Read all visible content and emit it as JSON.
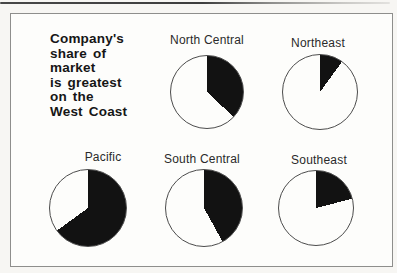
{
  "figure": {
    "headline_lines": [
      "Company's",
      "share of",
      "market",
      "is greatest",
      "on the",
      "West Coast"
    ],
    "headline_text": "Company's share of market is greatest on the West Coast"
  },
  "colors": {
    "slice": "#121212",
    "pie_fill": "#fdfdfb",
    "circle_outline": "#4c4c4c",
    "frame_border": "#8e8e8c",
    "panel_background": "#fdfdfb",
    "text": "#161616"
  },
  "chart_data": {
    "type": "pie",
    "title": "Company's share of market is greatest on the West Coast",
    "legend": "Solid black slice = company's share of market; each slice starts at 12 o'clock and sweeps clockwise",
    "pies": [
      {
        "label": "North Central",
        "share_pct": 37
      },
      {
        "label": "Northeast",
        "share_pct": 10
      },
      {
        "label": "Pacific",
        "share_pct": 65
      },
      {
        "label": "South Central",
        "share_pct": 42
      },
      {
        "label": "Southeast",
        "share_pct": 21
      }
    ]
  }
}
